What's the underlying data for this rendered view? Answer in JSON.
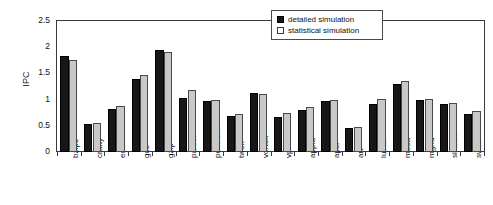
{
  "chart_data": {
    "type": "bar",
    "title": "",
    "xlabel": "",
    "ylabel": "IPC",
    "ylim": [
      0,
      2.5
    ],
    "yticks": [
      "0",
      "0.5",
      "1",
      "1.5",
      "2",
      "2.5"
    ],
    "ytick_values": [
      0,
      0.5,
      1,
      1.5,
      2,
      2.5
    ],
    "grid": false,
    "legend_position": "top-right",
    "categories": [
      "bzip2",
      "crafty",
      "eon",
      "gcc",
      "gzip",
      "parser",
      "perlbmk",
      "twolf",
      "vortex",
      "vpr",
      "applu",
      "apsi",
      "art",
      "lucas",
      "mesa",
      "mgrid",
      "sixtrack",
      "swim"
    ],
    "series": [
      {
        "name": "detailed simulation",
        "color": "#171717",
        "values": [
          1.83,
          0.54,
          0.83,
          1.39,
          1.94,
          1.04,
          0.97,
          0.69,
          1.12,
          0.67,
          0.8,
          0.98,
          0.46,
          0.92,
          1.3,
          1.0,
          0.92,
          0.73
        ]
      },
      {
        "name": "statistical simulation",
        "color": "#c8c8c8",
        "values": [
          1.75,
          0.56,
          0.87,
          1.47,
          1.91,
          1.19,
          0.99,
          0.72,
          1.1,
          0.74,
          0.85,
          0.99,
          0.48,
          1.01,
          1.36,
          1.02,
          0.94,
          0.78
        ]
      }
    ]
  },
  "legend": {
    "items": [
      {
        "label": "detailed simulation",
        "style": "detailed"
      },
      {
        "label": "statistical simulation",
        "style": "statistical"
      }
    ]
  }
}
